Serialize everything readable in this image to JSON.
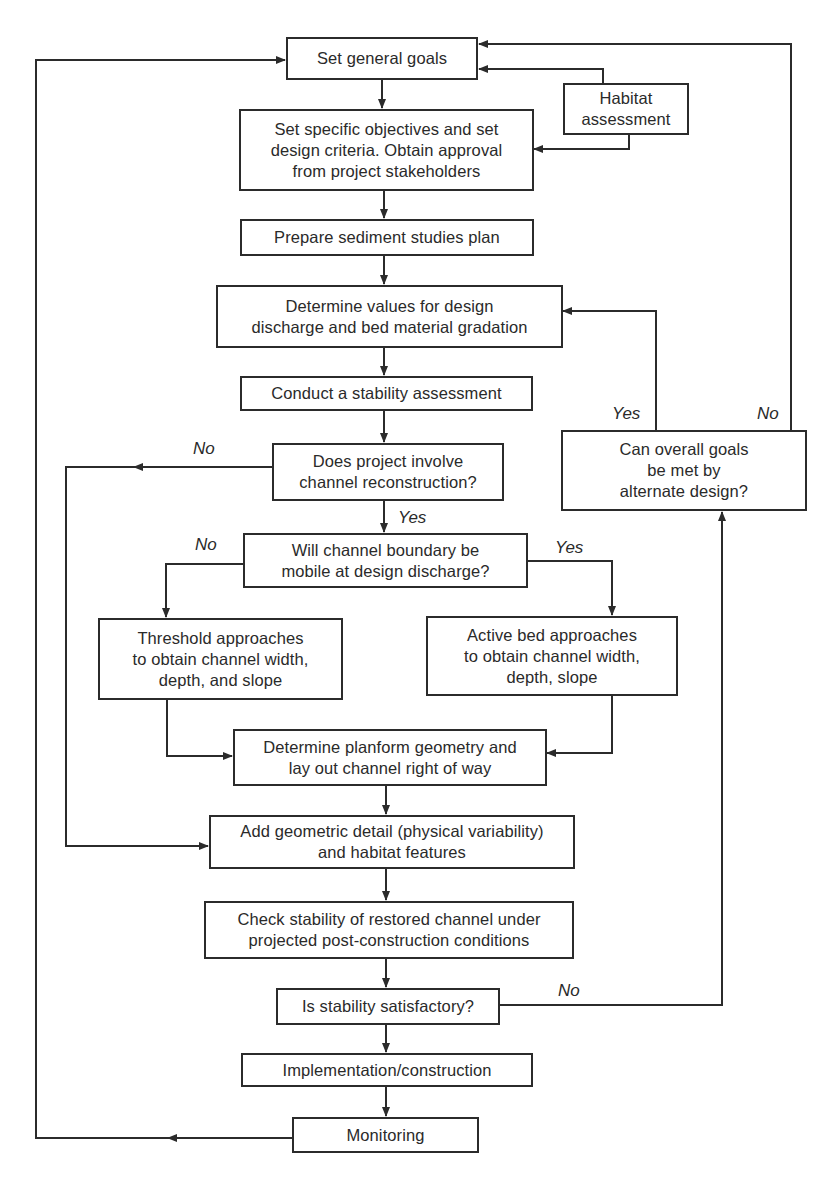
{
  "diagram": {
    "type": "flowchart",
    "nodes": {
      "set_general_goals": "Set general goals",
      "habitat_assessment": "Habitat\nassessment",
      "set_specific_objectives": "Set specific objectives and set\ndesign criteria. Obtain approval\nfrom project stakeholders",
      "prepare_sediment_plan": "Prepare sediment studies plan",
      "determine_values": "Determine values for design\ndischarge and bed material gradation",
      "conduct_stability_assessment": "Conduct a stability assessment",
      "does_project_involve": "Does project involve\nchannel reconstruction?",
      "can_overall_goals": "Can overall goals\nbe met by\nalternate design?",
      "will_channel_boundary": "Will channel boundary be\nmobile at design discharge?",
      "threshold_approaches": "Threshold approaches\nto obtain channel width,\ndepth, and slope",
      "active_bed_approaches": "Active bed approaches\nto obtain channel width,\ndepth, slope",
      "determine_planform": "Determine planform geometry and\nlay out channel right of way",
      "add_geometric_detail": "Add geometric detail (physical variability)\nand habitat features",
      "check_stability": "Check stability of restored channel under\nprojected post-construction conditions",
      "is_stability_satisfactory": "Is stability satisfactory?",
      "implementation": "Implementation/construction",
      "monitoring": "Monitoring"
    },
    "edge_labels": {
      "does_project_no": "No",
      "does_project_yes": "Yes",
      "will_channel_no": "No",
      "will_channel_yes": "Yes",
      "can_goals_yes": "Yes",
      "can_goals_no": "No",
      "stability_no": "No"
    },
    "edges": [
      {
        "from": "set_general_goals",
        "to": "set_specific_objectives"
      },
      {
        "from": "habitat_assessment",
        "to": "set_general_goals"
      },
      {
        "from": "habitat_assessment",
        "to": "set_specific_objectives"
      },
      {
        "from": "set_specific_objectives",
        "to": "prepare_sediment_plan"
      },
      {
        "from": "prepare_sediment_plan",
        "to": "determine_values"
      },
      {
        "from": "determine_values",
        "to": "conduct_stability_assessment"
      },
      {
        "from": "conduct_stability_assessment",
        "to": "does_project_involve"
      },
      {
        "from": "does_project_involve",
        "to": "will_channel_boundary",
        "label": "Yes"
      },
      {
        "from": "does_project_involve",
        "to": "add_geometric_detail",
        "label": "No"
      },
      {
        "from": "will_channel_boundary",
        "to": "threshold_approaches",
        "label": "No"
      },
      {
        "from": "will_channel_boundary",
        "to": "active_bed_approaches",
        "label": "Yes"
      },
      {
        "from": "threshold_approaches",
        "to": "determine_planform"
      },
      {
        "from": "active_bed_approaches",
        "to": "determine_planform"
      },
      {
        "from": "determine_planform",
        "to": "add_geometric_detail"
      },
      {
        "from": "add_geometric_detail",
        "to": "check_stability"
      },
      {
        "from": "check_stability",
        "to": "is_stability_satisfactory"
      },
      {
        "from": "is_stability_satisfactory",
        "to": "implementation"
      },
      {
        "from": "is_stability_satisfactory",
        "to": "can_overall_goals",
        "label": "No"
      },
      {
        "from": "can_overall_goals",
        "to": "determine_values",
        "label": "Yes"
      },
      {
        "from": "can_overall_goals",
        "to": "set_general_goals",
        "label": "No"
      },
      {
        "from": "implementation",
        "to": "monitoring"
      },
      {
        "from": "monitoring",
        "to": "set_general_goals"
      }
    ],
    "colors": {
      "line": "#2b2b2b",
      "background": "#ffffff",
      "text": "#2a2a2a"
    }
  }
}
